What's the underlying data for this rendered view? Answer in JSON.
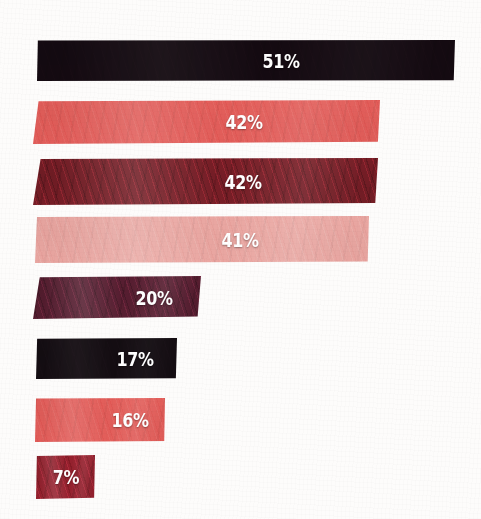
{
  "chart_data": {
    "type": "bar",
    "orientation": "horizontal",
    "title": "",
    "subtitle": "",
    "xlabel": "",
    "ylabel": "",
    "categories": [
      "",
      "",
      "",
      "",
      "",
      "",
      "",
      ""
    ],
    "values": [
      51,
      42,
      42,
      41,
      20,
      17,
      16,
      7
    ],
    "value_labels": [
      "51%",
      "42%",
      "42%",
      "41%",
      "20%",
      "17%",
      "16%",
      "7%"
    ],
    "unit": "%",
    "xlim": [
      0,
      56
    ],
    "grid": false,
    "axis_visible": false,
    "legend": false,
    "legend_position": "none",
    "label_color": "#ffffff",
    "background_color": "#fdfcfb",
    "bar_colors": [
      "#140a11",
      "#e8605c",
      "#7d1f28",
      "#eea9a4",
      "#5c1f33",
      "#140d12",
      "#e8605c",
      "#9e2230"
    ],
    "style": "hand-painted textured bars with white bold condensed percentage labels"
  },
  "bars": [
    {
      "name": "bar-51",
      "label": "51%",
      "value": 51,
      "color": "#140a11",
      "x": 37,
      "y": 40,
      "width": 418,
      "height": 41,
      "label_center": 244,
      "clip": "polygon(0.2% 1%, 100% 0%, 99.7% 98%, 0% 100%)",
      "texture": "smooth-dark"
    },
    {
      "name": "bar-42-a",
      "label": "42%",
      "value": 42,
      "color": "#e8605c",
      "x": 33,
      "y": 100,
      "width": 347,
      "height": 44,
      "label_center": 211,
      "clip": "polygon(1.6% 3%, 100% 0%, 99.4% 95%, 0% 100%)",
      "texture": "flat-wash"
    },
    {
      "name": "bar-42-b",
      "label": "42%",
      "value": 42,
      "color": "#7d1f28",
      "x": 33,
      "y": 158,
      "width": 345,
      "height": 47,
      "label_center": 210,
      "clip": "polygon(2.2% 2%, 100% 0%, 99.2% 96%, 0% 100%)",
      "texture": "streaked-grain"
    },
    {
      "name": "bar-41",
      "label": "41%",
      "value": 41,
      "color": "#eea9a4",
      "x": 35,
      "y": 216,
      "width": 334,
      "height": 47,
      "label_center": 205,
      "clip": "polygon(0.6% 2%, 100% 0%, 99.6% 97%, 0% 100%)",
      "texture": "soft-wash"
    },
    {
      "name": "bar-20",
      "label": "20%",
      "value": 20,
      "color": "#5c1f33",
      "x": 33,
      "y": 276,
      "width": 168,
      "height": 43,
      "label_center": 121,
      "clip": "polygon(4% 3%, 100% 0%, 98% 94%, 0% 100%)",
      "texture": "streaked-grain"
    },
    {
      "name": "bar-17",
      "label": "17%",
      "value": 17,
      "color": "#140d12",
      "x": 36,
      "y": 338,
      "width": 141,
      "height": 41,
      "label_center": 99,
      "clip": "polygon(0.8% 2%, 100% 0%, 99.2% 98%, 0% 100%)",
      "texture": "smooth-dark"
    },
    {
      "name": "bar-16",
      "label": "16%",
      "value": 16,
      "color": "#e8605c",
      "x": 35,
      "y": 398,
      "width": 130,
      "height": 44,
      "label_center": 95,
      "clip": "polygon(0.8% 1%, 100% 0%, 99.4% 98%, 0% 100%)",
      "texture": "flat-wash"
    },
    {
      "name": "bar-7",
      "label": "7%",
      "value": 7,
      "color": "#9e2230",
      "x": 36,
      "y": 455,
      "width": 59,
      "height": 44,
      "label_center": 30,
      "clip": "polygon(1.5% 2%, 100% 0%, 98.5% 97%, 0% 100%)",
      "texture": "streaked-grain"
    }
  ]
}
